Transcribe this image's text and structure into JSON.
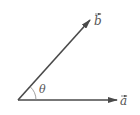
{
  "diagram": {
    "title": "",
    "vectors": [
      {
        "name": "a",
        "label": "a",
        "has_arrow_over_label": true,
        "direction": "horizontal-right"
      },
      {
        "name": "b",
        "label": "b",
        "has_arrow_over_label": true,
        "direction": "up-right"
      }
    ],
    "angle": {
      "label": "θ",
      "between": [
        "a",
        "b"
      ]
    },
    "colors": {
      "line": "#4a4a4a",
      "label": "#555555",
      "arc": "#888888",
      "background": "#ffffff"
    }
  }
}
